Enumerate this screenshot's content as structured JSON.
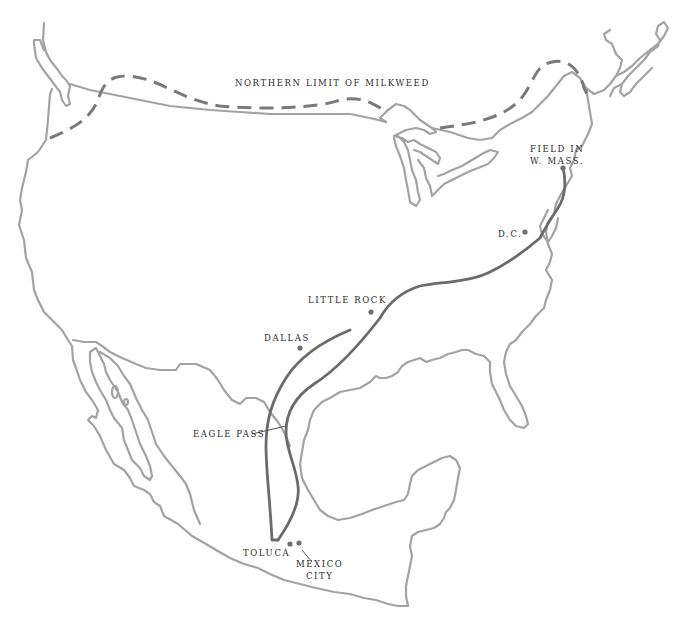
{
  "map": {
    "title": "",
    "colors": {
      "background": "#ffffff",
      "coastline": "#a3a3a3",
      "milkweed_limit": "#7a7a7a",
      "migration_route": "#6b6b6b",
      "city_dot": "#6f6f6f",
      "label_text": "#2a2a2a"
    },
    "annotations": {
      "northern_limit": "NORTHERN LIMIT OF MILKWEED"
    },
    "places": [
      {
        "id": "field-w-mass",
        "line1": "FIELD IN",
        "line2": "W. MASS."
      },
      {
        "id": "dc",
        "line1": "D.C."
      },
      {
        "id": "little-rock",
        "line1": "LITTLE ROCK"
      },
      {
        "id": "dallas",
        "line1": "DALLAS"
      },
      {
        "id": "eagle-pass",
        "line1": "EAGLE PASS"
      },
      {
        "id": "toluca",
        "line1": "TOLUCA"
      },
      {
        "id": "mexico-city",
        "line1": "MEXICO",
        "line2": "CITY"
      }
    ]
  }
}
